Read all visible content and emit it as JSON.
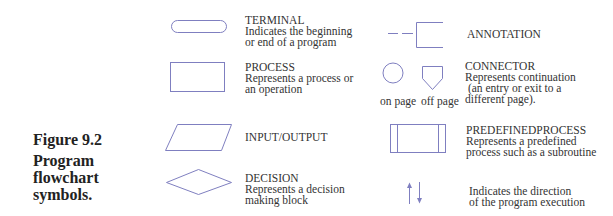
{
  "figure": {
    "number": "Figure 9.2",
    "caption_lines": [
      "Program",
      "flowchart",
      "symbols."
    ]
  },
  "colors": {
    "shape_stroke": "#7f7fc0",
    "text": "#333333",
    "caption": "#222222",
    "background": "#ffffff"
  },
  "symbols": {
    "terminal": {
      "title": "TERMINAL",
      "lines": [
        "Indicates the beginning",
        "or end of a program"
      ]
    },
    "process": {
      "title": "PROCESS",
      "lines": [
        "Represents a process or",
        "an operation"
      ]
    },
    "input_output": {
      "title": "INPUT/OUTPUT",
      "lines": []
    },
    "decision": {
      "title": "DECISION",
      "lines": [
        "Represents a decision",
        "making block"
      ]
    },
    "annotation": {
      "title": "ANNOTATION",
      "lines": []
    },
    "connector": {
      "title": "CONNECTOR",
      "lines": [
        "Represents continuation",
        " (an entry or exit to a",
        "different page)."
      ],
      "on_page_label": "on page",
      "off_page_label": "off page"
    },
    "predefined_process": {
      "title": "PREDEFINEDPROCESS",
      "lines": [
        "Represents a predefined",
        "process such as a subroutine"
      ]
    },
    "flow_lines": {
      "title": "",
      "lines": [
        "Indicates the direction",
        "of the program execution"
      ]
    }
  }
}
